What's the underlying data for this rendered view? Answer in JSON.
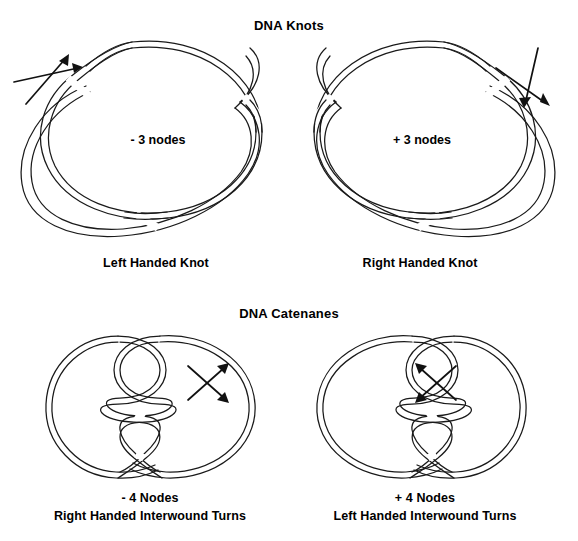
{
  "figure": {
    "background_color": "#ffffff",
    "ink_color": "#1a1a1a",
    "sections": [
      {
        "id": "dna-knots",
        "title": "DNA Knots"
      },
      {
        "id": "dna-catenanes",
        "title": "DNA Catenanes"
      }
    ]
  },
  "knots": {
    "title": "DNA Knots",
    "left": {
      "node_label": "- 3 nodes",
      "caption": "Left Handed Knot",
      "crossing_sign": "-",
      "node_count": 3,
      "arrow_symbol": "crossing-arrows-up-right",
      "topology": "trefoil-knot"
    },
    "right": {
      "node_label": "+ 3 nodes",
      "caption": "Right Handed Knot",
      "crossing_sign": "+",
      "node_count": 3,
      "arrow_symbol": "crossing-arrows-down-right",
      "topology": "trefoil-knot"
    }
  },
  "catenanes": {
    "title": "DNA Catenanes",
    "left": {
      "node_label": "- 4 Nodes",
      "caption_line2": "Right Handed Interwound Turns",
      "crossing_sign": "-",
      "node_count": 4,
      "arrow_symbol": "crossing-arrows-right",
      "topology": "interwound-catenane"
    },
    "right": {
      "node_label": "+ 4 Nodes",
      "caption_line2": "Left Handed Interwound Turns",
      "crossing_sign": "+",
      "node_count": 4,
      "arrow_symbol": "crossing-arrows-left",
      "topology": "interwound-catenane"
    }
  }
}
